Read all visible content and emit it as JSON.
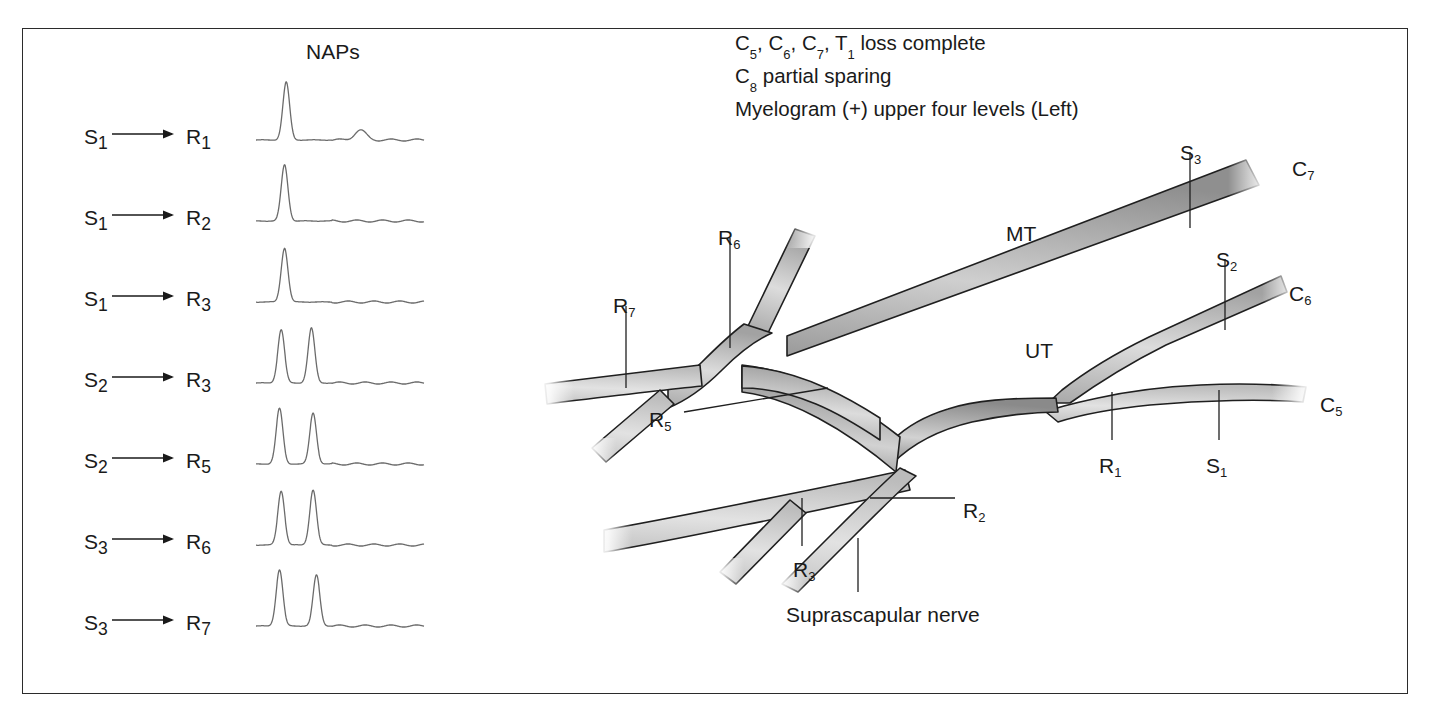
{
  "figure": {
    "background_color": "#ffffff",
    "border_color": "#2b2b2b",
    "trace_color": "#6b6b6b",
    "nerve_outline_color": "#1f1f1f",
    "nerve_fill_light": "#d9d9d9",
    "nerve_fill_dark": "#8a8a8a"
  },
  "naps_panel": {
    "title": "NAPs",
    "rows": [
      {
        "stimulus": "S",
        "stimulus_sub": "1",
        "recording": "R",
        "recording_sub": "1",
        "label": "S1 → R1"
      },
      {
        "stimulus": "S",
        "stimulus_sub": "1",
        "recording": "R",
        "recording_sub": "2",
        "label": "S1 → R2"
      },
      {
        "stimulus": "S",
        "stimulus_sub": "1",
        "recording": "R",
        "recording_sub": "3",
        "label": "S1 → R3"
      },
      {
        "stimulus": "S",
        "stimulus_sub": "2",
        "recording": "R",
        "recording_sub": "3",
        "label": "S2 → R3"
      },
      {
        "stimulus": "S",
        "stimulus_sub": "2",
        "recording": "R",
        "recording_sub": "5",
        "label": "S2 → R5"
      },
      {
        "stimulus": "S",
        "stimulus_sub": "3",
        "recording": "R",
        "recording_sub": "6",
        "label": "S3 → R6"
      },
      {
        "stimulus": "S",
        "stimulus_sub": "3",
        "recording": "R",
        "recording_sub": "7",
        "label": "S3 → R7"
      }
    ]
  },
  "clinical_note": {
    "line1_prefix": "C",
    "line1": "C5, C6, C7, T1 loss complete",
    "line2": "C8 partial sparing",
    "line3": "Myelogram (+) upper four levels (Left)"
  },
  "plexus_labels": [
    {
      "name": "C7",
      "text": "C",
      "sub": "7",
      "x": 1292,
      "y": 158
    },
    {
      "name": "C6",
      "text": "C",
      "sub": "6",
      "x": 1289,
      "y": 283
    },
    {
      "name": "C5",
      "text": "C",
      "sub": "5",
      "x": 1320,
      "y": 394
    },
    {
      "name": "S3",
      "text": "S",
      "sub": "3",
      "x": 1180,
      "y": 142
    },
    {
      "name": "S2",
      "text": "S",
      "sub": "2",
      "x": 1216,
      "y": 249
    },
    {
      "name": "S1",
      "text": "S",
      "sub": "1",
      "x": 1206,
      "y": 455
    },
    {
      "name": "R1",
      "text": "R",
      "sub": "1",
      "x": 1099,
      "y": 455
    },
    {
      "name": "R2",
      "text": "R",
      "sub": "2",
      "x": 963,
      "y": 500
    },
    {
      "name": "R3",
      "text": "R",
      "sub": "3",
      "x": 793,
      "y": 559
    },
    {
      "name": "R5",
      "text": "R",
      "sub": "5",
      "x": 649,
      "y": 409
    },
    {
      "name": "R6",
      "text": "R",
      "sub": "6",
      "x": 718,
      "y": 227
    },
    {
      "name": "R7",
      "text": "R",
      "sub": "7",
      "x": 613,
      "y": 295
    },
    {
      "name": "MT",
      "text": "MT",
      "sub": "",
      "x": 1006,
      "y": 223
    },
    {
      "name": "UT",
      "text": "UT",
      "sub": "",
      "x": 1025,
      "y": 340
    },
    {
      "name": "suprascapular-nerve",
      "text": "Suprascapular nerve",
      "sub": "",
      "x": 786,
      "y": 604
    }
  ],
  "chart_data": {
    "type": "line",
    "title": "NAPs",
    "xlabel": "",
    "ylabel": "",
    "grid": false,
    "legend": "none",
    "series": [
      {
        "name": "S1 → R1",
        "peaks": [
          {
            "position": 0.18,
            "amplitude": 1.0
          },
          {
            "position": 0.62,
            "amplitude": 0.17
          }
        ]
      },
      {
        "name": "S1 → R2",
        "peaks": [
          {
            "position": 0.17,
            "amplitude": 0.97
          }
        ]
      },
      {
        "name": "S1 → R3",
        "peaks": [
          {
            "position": 0.17,
            "amplitude": 0.93
          }
        ]
      },
      {
        "name": "S2 → R3",
        "peaks": [
          {
            "position": 0.15,
            "amplitude": 0.92
          },
          {
            "position": 0.33,
            "amplitude": 0.95
          }
        ]
      },
      {
        "name": "S2 → R5",
        "peaks": [
          {
            "position": 0.14,
            "amplitude": 0.96
          },
          {
            "position": 0.34,
            "amplitude": 0.88
          }
        ]
      },
      {
        "name": "S3 → R6",
        "peaks": [
          {
            "position": 0.15,
            "amplitude": 0.93
          },
          {
            "position": 0.34,
            "amplitude": 0.95
          }
        ]
      },
      {
        "name": "S3 → R7",
        "peaks": [
          {
            "position": 0.14,
            "amplitude": 0.97
          },
          {
            "position": 0.36,
            "amplitude": 0.88
          }
        ]
      }
    ]
  }
}
